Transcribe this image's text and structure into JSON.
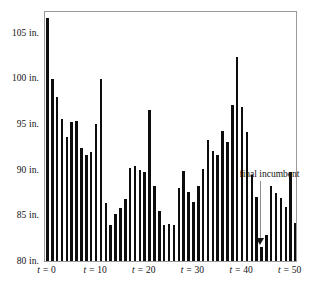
{
  "chart_data": {
    "type": "bar",
    "title": "",
    "subtitle": "",
    "xlabel": "",
    "ylabel": "",
    "ylim": [
      80,
      107.5
    ],
    "xlim": [
      -0.5,
      51.5
    ],
    "grid": false,
    "legend": null,
    "y_unit": "in.",
    "y_ticks": [
      80,
      85,
      90,
      95,
      100,
      105
    ],
    "y_tick_labels": [
      "80 in.",
      "85 in.",
      "90 in.",
      "95 in.",
      "100 in.",
      "105 in."
    ],
    "x_ticks": [
      0,
      10,
      20,
      30,
      40,
      50
    ],
    "x_tick_labels": [
      "t = 0",
      "t = 10",
      "t = 20",
      "t = 30",
      "t = 40",
      "t = 50"
    ],
    "bar_color": "#0d0d0d",
    "x": [
      0,
      1,
      2,
      3,
      4,
      5,
      6,
      7,
      8,
      9,
      10,
      11,
      12,
      13,
      14,
      15,
      16,
      17,
      18,
      19,
      20,
      21,
      22,
      23,
      24,
      25,
      26,
      27,
      28,
      29,
      30,
      31,
      32,
      33,
      34,
      35,
      36,
      37,
      38,
      39,
      40,
      41,
      42,
      43,
      44,
      45,
      46,
      47,
      48,
      49,
      50,
      51
    ],
    "values": [
      106.6,
      99.9,
      98.0,
      95.6,
      93.6,
      95.2,
      95.3,
      92.4,
      91.6,
      91.9,
      95.0,
      99.9,
      86.4,
      84.0,
      85.2,
      85.8,
      86.8,
      90.2,
      90.4,
      90.0,
      89.8,
      96.6,
      88.2,
      85.5,
      84.0,
      84.1,
      83.9,
      88.0,
      89.9,
      87.6,
      86.5,
      88.2,
      90.1,
      93.3,
      92.0,
      91.6,
      94.2,
      93.0,
      97.1,
      102.4,
      96.9,
      94.1,
      89.4,
      87.0,
      81.5,
      82.8,
      88.2,
      87.5,
      86.9,
      85.9,
      89.7,
      84.2
    ],
    "annotations": [
      {
        "text": "final incumbent",
        "points_to_x": 44,
        "points_to_value": 81.5,
        "arrow": "down"
      }
    ]
  },
  "axis": {
    "y_labels": [
      {
        "value": 105,
        "text": "105 in."
      },
      {
        "value": 100,
        "text": "100 in."
      },
      {
        "value": 95,
        "text": "95 in."
      },
      {
        "value": 90,
        "text": "90 in."
      },
      {
        "value": 85,
        "text": "85 in."
      },
      {
        "value": 80,
        "text": "80 in."
      }
    ],
    "x_labels": [
      {
        "value": 0,
        "prefix": "t = ",
        "number": "0"
      },
      {
        "value": 10,
        "prefix": "t = ",
        "number": "10"
      },
      {
        "value": 20,
        "prefix": "t = ",
        "number": "20"
      },
      {
        "value": 30,
        "prefix": "t = ",
        "number": "30"
      },
      {
        "value": 40,
        "prefix": "t = ",
        "number": "40"
      },
      {
        "value": 50,
        "prefix": "t = ",
        "number": "50"
      }
    ]
  },
  "annotation": {
    "label": "final incumbent"
  }
}
